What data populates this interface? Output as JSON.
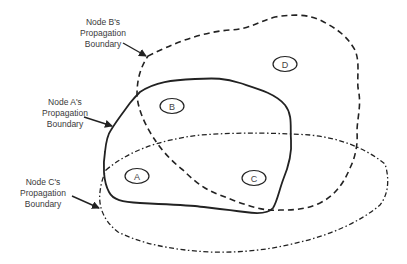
{
  "diagram": {
    "type": "venn-like propagation boundary diagram",
    "colors": {
      "stroke": "#222222",
      "text": "#3a3a3a",
      "background": "#ffffff"
    },
    "labels": {
      "b": {
        "line1": "Node B's",
        "line2": "Propagation",
        "line3": "Boundary"
      },
      "a": {
        "line1": "Node A's",
        "line2": "Propagation",
        "line3": "Boundary"
      },
      "c": {
        "line1": "Node C's",
        "line2": "Propagation",
        "line3": "Boundary"
      }
    },
    "nodes": [
      {
        "id": "A",
        "label": "A"
      },
      {
        "id": "B",
        "label": "B"
      },
      {
        "id": "C",
        "label": "C"
      },
      {
        "id": "D",
        "label": "D"
      }
    ],
    "boundaries": [
      {
        "node": "A",
        "line_style": "solid"
      },
      {
        "node": "B",
        "line_style": "dashed"
      },
      {
        "node": "C",
        "line_style": "dash-dot"
      }
    ]
  }
}
